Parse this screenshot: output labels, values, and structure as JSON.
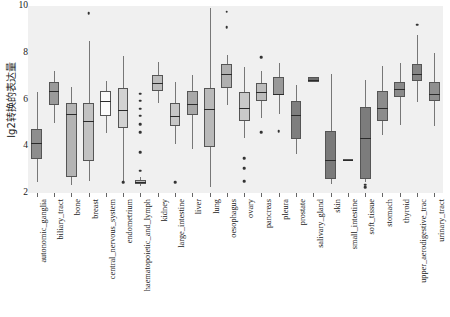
{
  "chart_data": {
    "type": "box",
    "title": "",
    "xlabel": "",
    "ylabel": "lg2转换的表达量",
    "ylim": [
      2,
      10
    ],
    "yticks": [
      2,
      4,
      6,
      8,
      10
    ],
    "grid": false,
    "legend": "none",
    "categories": [
      "autonomic_ganglia",
      "biliary_tract",
      "bone",
      "breast",
      "central_nervous_system",
      "endometrium",
      "haematopoietic_and_lymph",
      "kidney",
      "large_intestine",
      "liver",
      "lung",
      "oesophagus",
      "ovary",
      "pancreas",
      "pleura",
      "prostate",
      "salivary_gland",
      "skin",
      "small_intestine",
      "soft_tissue",
      "stomach",
      "thyroid",
      "upper_aerodigestive_trac",
      "urinary_tract"
    ],
    "boxes": [
      {
        "label": "autonomic_ganglia",
        "q1": 3.45,
        "median": 4.15,
        "q3": 4.75,
        "whisker_low": 2.45,
        "whisker_high": 6.3,
        "fill": "#8e8e8e",
        "outliers": []
      },
      {
        "label": "biliary_tract",
        "q1": 5.75,
        "median": 6.35,
        "q3": 6.75,
        "whisker_low": 5.0,
        "whisker_high": 7.2,
        "fill": "#9a9a9a",
        "outliers": []
      },
      {
        "label": "bone",
        "q1": 2.7,
        "median": 5.4,
        "q3": 5.85,
        "whisker_low": 2.35,
        "whisker_high": 6.55,
        "fill": "#b4b4b4",
        "outliers": []
      },
      {
        "label": "breast",
        "q1": 3.35,
        "median": 5.1,
        "q3": 5.85,
        "whisker_low": 2.5,
        "whisker_high": 8.5,
        "fill": "#c2c2c2",
        "outliers": [
          9.7
        ]
      },
      {
        "label": "central_nervous_system",
        "q1": 5.3,
        "median": 5.95,
        "q3": 6.35,
        "whisker_low": 4.55,
        "whisker_high": 6.8,
        "fill": "#fbfbfb",
        "outliers": []
      },
      {
        "label": "endometrium",
        "q1": 4.8,
        "median": 5.55,
        "q3": 6.5,
        "whisker_low": 2.45,
        "whisker_high": 7.85,
        "fill": "#d2d2d2",
        "outliers": [
          2.45
        ]
      },
      {
        "label": "haematopoietic_and_lymph",
        "q1": 2.4,
        "median": 2.47,
        "q3": 2.55,
        "whisker_low": 2.3,
        "whisker_high": 2.7,
        "fill": "#bfbfbf",
        "outliers": [
          6.25,
          5.95,
          5.6,
          5.3,
          4.95,
          4.6,
          3.75,
          2.95
        ]
      },
      {
        "label": "kidney",
        "q1": 6.35,
        "median": 6.7,
        "q3": 7.05,
        "whisker_low": 5.85,
        "whisker_high": 7.6,
        "fill": "#bdbdbd",
        "outliers": []
      },
      {
        "label": "large_intestine",
        "q1": 4.85,
        "median": 5.3,
        "q3": 5.85,
        "whisker_low": 4.1,
        "whisker_high": 6.75,
        "fill": "#c7c7c7",
        "outliers": [
          2.45
        ]
      },
      {
        "label": "liver",
        "q1": 5.35,
        "median": 5.8,
        "q3": 6.35,
        "whisker_low": 3.9,
        "whisker_high": 7.05,
        "fill": "#a8a8a8",
        "outliers": []
      },
      {
        "label": "lung",
        "q1": 3.95,
        "median": 5.6,
        "q3": 6.5,
        "whisker_low": 2.25,
        "whisker_high": 9.9,
        "fill": "#b9b9b9",
        "outliers": []
      },
      {
        "label": "oesophagus",
        "q1": 6.5,
        "median": 7.1,
        "q3": 7.5,
        "whisker_low": 5.75,
        "whisker_high": 7.9,
        "fill": "#b0b0b0",
        "outliers": [
          9.75,
          9.1
        ]
      },
      {
        "label": "ovary",
        "q1": 5.1,
        "median": 5.65,
        "q3": 6.3,
        "whisker_low": 4.35,
        "whisker_high": 7.4,
        "fill": "#c9c9c9",
        "outliers": [
          3.5,
          3.05,
          2.5
        ]
      },
      {
        "label": "pancreas",
        "q1": 5.95,
        "median": 6.3,
        "q3": 6.7,
        "whisker_low": 5.2,
        "whisker_high": 7.2,
        "fill": "#bcbcbc",
        "outliers": [
          7.8,
          4.6
        ]
      },
      {
        "label": "pleura",
        "q1": 6.2,
        "median": 6.25,
        "q3": 6.95,
        "whisker_low": 5.4,
        "whisker_high": 7.55,
        "fill": "#999999",
        "outliers": [
          4.65
        ]
      },
      {
        "label": "prostate",
        "q1": 4.3,
        "median": 5.35,
        "q3": 5.95,
        "whisker_low": 3.65,
        "whisker_high": 6.6,
        "fill": "#7e7e7e",
        "outliers": []
      },
      {
        "label": "salivary_gland",
        "q1": 6.75,
        "median": 6.85,
        "q3": 6.95,
        "whisker_low": 6.75,
        "whisker_high": 6.95,
        "fill": "#6e6e6e",
        "outliers": []
      },
      {
        "label": "skin",
        "q1": 2.6,
        "median": 3.4,
        "q3": 4.65,
        "whisker_low": 2.4,
        "whisker_high": 7.1,
        "fill": "#7a7a7a",
        "outliers": []
      },
      {
        "label": "small_intestine",
        "q1": 3.4,
        "median": 3.42,
        "q3": 3.45,
        "whisker_low": 3.4,
        "whisker_high": 3.45,
        "fill": "#6a6a6a",
        "outliers": []
      },
      {
        "label": "soft_tissue",
        "q1": 2.6,
        "median": 4.35,
        "q3": 5.7,
        "whisker_low": 2.45,
        "whisker_high": 6.85,
        "fill": "#7c7c7c",
        "outliers": [
          2.35,
          2.25
        ]
      },
      {
        "label": "stomach",
        "q1": 5.1,
        "median": 5.65,
        "q3": 6.35,
        "whisker_low": 4.5,
        "whisker_high": 7.45,
        "fill": "#8c8c8c",
        "outliers": []
      },
      {
        "label": "thyroid",
        "q1": 6.1,
        "median": 6.45,
        "q3": 6.75,
        "whisker_low": 4.9,
        "whisker_high": 7.55,
        "fill": "#8a8a8a",
        "outliers": []
      },
      {
        "label": "upper_aerodigestive_trac",
        "q1": 6.8,
        "median": 7.1,
        "q3": 7.5,
        "whisker_low": 5.9,
        "whisker_high": 8.75,
        "fill": "#858585",
        "outliers": [
          9.2
        ]
      },
      {
        "label": "urinary_tract",
        "q1": 5.95,
        "median": 6.25,
        "q3": 6.75,
        "whisker_low": 4.85,
        "whisker_high": 8.0,
        "fill": "#8f8f8f",
        "outliers": []
      }
    ]
  }
}
